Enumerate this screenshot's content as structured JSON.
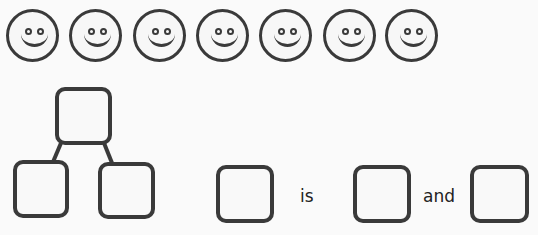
{
  "smileys": {
    "count": 7,
    "icon": "smiley-face-icon",
    "centers_x": [
      33,
      96,
      160,
      223,
      286,
      350,
      412
    ]
  },
  "number_bond": {
    "whole_box": "",
    "part_boxes": [
      "",
      ""
    ]
  },
  "sentence": {
    "box1": "",
    "word1": "is",
    "box2": "",
    "word2": "and",
    "box3": ""
  },
  "colors": {
    "stroke": "#3a3a3a",
    "background": "#fafafa"
  }
}
